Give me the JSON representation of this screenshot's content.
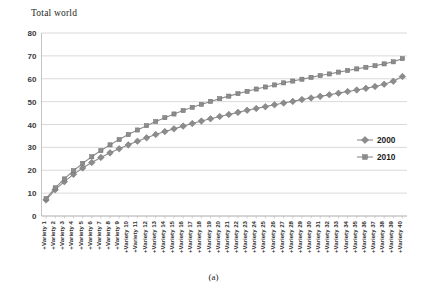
{
  "figure": {
    "title": "Total world",
    "caption": "(a)"
  },
  "legend": {
    "position": "right-middle",
    "items": [
      {
        "label": "2000",
        "marker": "diamond",
        "color": "#8c8c8c"
      },
      {
        "label": "2010",
        "marker": "square",
        "color": "#8c8c8c"
      }
    ]
  },
  "axes": {
    "y_ticks": [
      "0",
      "10",
      "20",
      "30",
      "40",
      "50",
      "60",
      "70",
      "80"
    ],
    "x_first": "+Variety 1",
    "x_last": "+Variety 40"
  },
  "chart_data": {
    "type": "line",
    "title": "Total world",
    "xlabel": "",
    "ylabel": "",
    "ylim": [
      0,
      80
    ],
    "grid": true,
    "legend_position": "right",
    "categories": [
      "+Variety 1",
      "+Variety 2",
      "+Variety 3",
      "+Variety 4",
      "+Variety 5",
      "+Variety 6",
      "+Variety 7",
      "+Variety 8",
      "+Variety 9",
      "+Variety 10",
      "+Variety 11",
      "+Variety 12",
      "+Variety 13",
      "+Variety 14",
      "+Variety 15",
      "+Variety 16",
      "+Variety 17",
      "+Variety 18",
      "+Variety 19",
      "+Variety 20",
      "+Variety 21",
      "+Variety 22",
      "+Variety 23",
      "+Variety 24",
      "+Variety 25",
      "+Variety 26",
      "+Variety 27",
      "+Variety 28",
      "+Variety 29",
      "+Variety 30",
      "+Variety 31",
      "+Variety 32",
      "+Variety 33",
      "+Variety 34",
      "+Variety 35",
      "+Variety 36",
      "+Variety 37",
      "+Variety 38",
      "+Variety 39",
      "+Variety 40"
    ],
    "series": [
      {
        "name": "2000",
        "marker": "diamond",
        "color": "#8c8c8c",
        "values": [
          7.0,
          11.5,
          15.0,
          18.2,
          21.0,
          23.4,
          25.6,
          27.6,
          29.4,
          31.1,
          32.7,
          34.2,
          35.6,
          36.9,
          38.1,
          39.3,
          40.4,
          41.5,
          42.5,
          43.5,
          44.4,
          45.3,
          46.2,
          47.0,
          47.8,
          48.6,
          49.4,
          50.1,
          50.9,
          51.6,
          52.3,
          53.0,
          53.7,
          54.4,
          55.1,
          55.8,
          56.6,
          57.6,
          58.9,
          61.0
        ]
      },
      {
        "name": "2010",
        "marker": "square",
        "color": "#8c8c8c",
        "values": [
          7.6,
          12.3,
          16.2,
          19.8,
          23.0,
          25.9,
          28.6,
          31.1,
          33.4,
          35.6,
          37.6,
          39.5,
          41.3,
          43.0,
          44.6,
          46.1,
          47.5,
          48.8,
          50.1,
          51.3,
          52.4,
          53.5,
          54.5,
          55.5,
          56.4,
          57.3,
          58.2,
          59.0,
          59.8,
          60.6,
          61.4,
          62.1,
          62.9,
          63.6,
          64.3,
          65.0,
          65.7,
          66.5,
          67.4,
          68.8
        ]
      }
    ]
  }
}
